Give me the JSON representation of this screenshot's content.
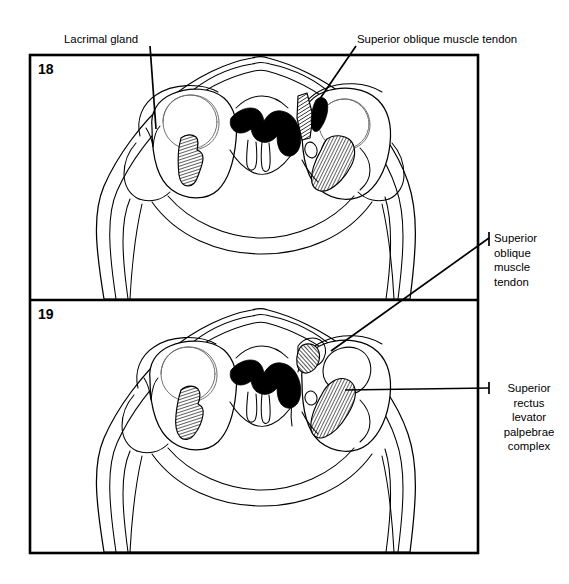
{
  "figure": {
    "kind": "anatomical-line-drawing",
    "background_color": "#ffffff",
    "ink_color": "#000000"
  },
  "panels": [
    {
      "id": "panel-18",
      "number": "18",
      "number_position": {
        "x": 38,
        "y": 61
      },
      "frame": {
        "x": 30,
        "y": 55,
        "width": 448,
        "height": 245
      }
    },
    {
      "id": "panel-19",
      "number": "19",
      "number_position": {
        "x": 38,
        "y": 306
      },
      "frame": {
        "x": 30,
        "y": 300,
        "width": 448,
        "height": 253
      }
    }
  ],
  "labels": [
    {
      "id": "lacrimal-gland",
      "text": "Lacrimal gland",
      "layout": "inline",
      "position": {
        "x": 64,
        "y": 33
      },
      "points_to_panel": "18",
      "points_to_structure": "lacrimal gland, left orbit",
      "leader": {
        "from": {
          "x": 150,
          "y": 46
        },
        "to": {
          "x": 156,
          "y": 129
        }
      }
    },
    {
      "id": "superior-oblique-muscle-tendon-top",
      "text": "Superior oblique muscle tendon",
      "layout": "inline",
      "position": {
        "x": 357,
        "y": 33
      },
      "points_to_panel": "18",
      "points_to_structure": "superior oblique muscle tendon, right orbit",
      "leader": {
        "from": {
          "x": 355,
          "y": 46
        },
        "to": {
          "x": 317,
          "y": 103
        }
      }
    },
    {
      "id": "superior-oblique-muscle-tendon-right",
      "text": "Superior\noblique\nmuscle\ntendon",
      "lines": [
        "Superior",
        "oblique",
        "muscle",
        "tendon"
      ],
      "layout": "stacked-left",
      "position": {
        "x": 494,
        "y": 231
      },
      "points_to_panel": "19",
      "points_to_structure": "superior oblique muscle tendon, right orbit",
      "leader": {
        "from": {
          "x": 489,
          "y": 238
        },
        "to": {
          "x": 331,
          "y": 351
        }
      }
    },
    {
      "id": "superior-rectus-levator-palpebrae-complex",
      "text": "Superior\nrectus\nlevator\npalpebrae\ncomplex",
      "lines": [
        "Superior",
        "rectus",
        "levator",
        "palpebrae",
        "complex"
      ],
      "layout": "stacked-center",
      "position": {
        "x": 489,
        "y": 381
      },
      "points_to_panel": "19",
      "points_to_structure": "superior rectus / levator palpebrae superioris complex, right orbit",
      "leader": {
        "from": {
          "x": 489,
          "y": 388
        },
        "to": {
          "x": 345,
          "y": 390
        }
      }
    }
  ],
  "structures": {
    "panel_18": {
      "globes": [
        "left globe",
        "right globe"
      ],
      "black_filled": [
        "ethmoid / nasal air spaces"
      ],
      "hatched_muscles": [
        "left medial rectus-region muscle",
        "right superior oblique muscle belly",
        "right superior oblique tendon",
        "right superior rectus levator complex"
      ]
    },
    "panel_19": {
      "globes": [
        "left globe",
        "right globe"
      ],
      "black_filled": [
        "ethmoid / nasal air spaces"
      ],
      "hatched_muscles": [
        "left muscle",
        "right superior oblique muscle tendon",
        "right superior rectus levator palpebrae complex"
      ]
    }
  },
  "icon_names": {
    "panel_frame": "rectangle-frame",
    "leader": "leader-line",
    "hatch": "diagonal-hatch-pattern"
  }
}
